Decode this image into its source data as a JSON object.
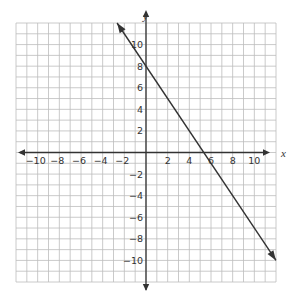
{
  "chart_data": {
    "type": "line",
    "title": "",
    "xlabel": "x",
    "ylabel": "y",
    "xlim": [
      -12,
      12
    ],
    "ylim": [
      -12,
      12
    ],
    "grid": true,
    "grid_step": 1,
    "xticks": [
      -10,
      -8,
      -6,
      -4,
      -2,
      2,
      4,
      6,
      8,
      10
    ],
    "yticks": [
      -10,
      -8,
      -6,
      -4,
      -2,
      2,
      4,
      6,
      8,
      10
    ],
    "xtick_labels": [
      "−10",
      "−8",
      "−6",
      "−4",
      "−2",
      "2",
      "4",
      "6",
      "8",
      "10"
    ],
    "ytick_labels": [
      "−10",
      "−8",
      "−6",
      "−4",
      "−2",
      "2",
      "4",
      "6",
      "8",
      "10"
    ],
    "series": [
      {
        "name": "line",
        "equation": "y = -1.5x + 8",
        "x": [
          -2.67,
          12
        ],
        "y": [
          12,
          -10
        ],
        "y_intercept": 8,
        "x_intercept": 5.33,
        "arrows_both_ends": true
      }
    ],
    "legend": null
  },
  "colors": {
    "grid": "#bdbdbd",
    "axis": "#333333",
    "line": "#333333"
  }
}
